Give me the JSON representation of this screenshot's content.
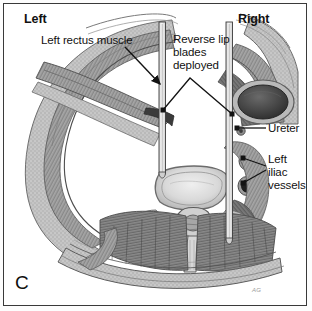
{
  "figure": {
    "panel_letter": "C",
    "signature": "AG",
    "orientation": {
      "left_label": "Left",
      "right_label": "Right"
    }
  },
  "annotations": [
    {
      "id": "left-rectus-muscle",
      "text": "Left rectus muscle",
      "target": "left anterior abdominal wall rectus muscle belly"
    },
    {
      "id": "reverse-lip-blades-deployed",
      "text": "Reverse lip\nblades\ndeployed",
      "target": "paired vertical retractor blades in the surgical corridor"
    },
    {
      "id": "ureter",
      "text": "Ureter",
      "target": "right retroperitoneal ureter"
    },
    {
      "id": "left-iliac-vessels",
      "text": "Left\niliac\nvessels",
      "target": "paired iliac artery and vein cross sections"
    }
  ],
  "anatomy": {
    "title": "Axial cross-section of the abdomen with retractor blades deployed",
    "structures": [
      "anterior abdominal wall",
      "left rectus muscle",
      "posterior paraspinal musculature",
      "psoas muscle",
      "vertebral body",
      "spinal canal",
      "spinous process",
      "ureter",
      "iliac artery",
      "iliac vein",
      "retractor blade left",
      "retractor blade right"
    ]
  },
  "colors": {
    "frame": "#3a3a3a",
    "background": "#ffffff",
    "label_text": "#111111",
    "leader_line": "#1a1a1a",
    "tissue_mid": "#8e8e8e",
    "tissue_dark": "#5a5a5a",
    "tissue_light": "#c9c9c9",
    "vessel_dark": "#2e2e2e",
    "blade_metal": "#e8e8e8"
  }
}
